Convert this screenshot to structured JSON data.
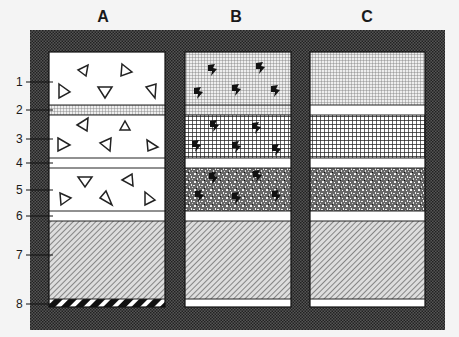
{
  "columns": [
    {
      "id": "A",
      "label": "A"
    },
    {
      "id": "B",
      "label": "B"
    },
    {
      "id": "C",
      "label": "C"
    }
  ],
  "layer_labels": [
    "1",
    "2",
    "3",
    "4",
    "5",
    "6",
    "7",
    "8"
  ],
  "layers": [
    {
      "num": "1",
      "A": "white with open triangles",
      "B": "fine grid with black clasts",
      "C": "fine grid"
    },
    {
      "num": "2",
      "A": "fine grid band",
      "B": "fine grid band",
      "C": "white band"
    },
    {
      "num": "3",
      "A": "white with open triangles",
      "B": "coarse grid with black clasts",
      "C": "coarse grid"
    },
    {
      "num": "4",
      "A": "white band",
      "B": "white band",
      "C": "white band"
    },
    {
      "num": "5",
      "A": "white with open triangles",
      "B": "speckled with black clasts",
      "C": "speckled"
    },
    {
      "num": "6",
      "A": "white band",
      "B": "white band",
      "C": "white band"
    },
    {
      "num": "7",
      "A": "diagonal hatching",
      "B": "diagonal hatching",
      "C": "diagonal hatching"
    },
    {
      "num": "8",
      "A": "black/white diagonal stripe",
      "B": "white band",
      "C": "white band"
    }
  ],
  "colors": {
    "frame": "#3a3a3a",
    "background": "#f4f4f4",
    "line": "#1a1a1a"
  }
}
